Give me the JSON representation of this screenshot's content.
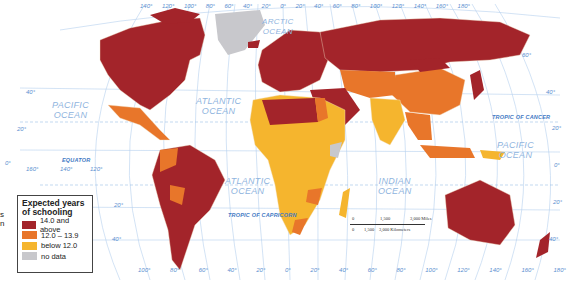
{
  "map": {
    "title": "Expected years of schooling",
    "oceans": [
      {
        "name": "ARCTIC\nOCEAN",
        "x": 262,
        "y": 17
      },
      {
        "name": "PACIFIC\nOCEAN",
        "x": 52,
        "y": 100
      },
      {
        "name": "ATLANTIC\nOCEAN",
        "x": 196,
        "y": 96
      },
      {
        "name": "ATLANTIC\nOCEAN",
        "x": 225,
        "y": 176
      },
      {
        "name": "INDIAN\nOCEAN",
        "x": 378,
        "y": 176
      },
      {
        "name": "PACIFIC\nOCEAN",
        "x": 497,
        "y": 140
      }
    ],
    "lines": {
      "equator": "EQUATOR",
      "tropic_cancer": "TROPIC OF CANCER",
      "tropic_capricorn": "TROPIC OF CAPRICORN"
    },
    "top_longitudes": [
      "140°",
      "120°",
      "100°",
      "80°",
      "60°",
      "40°",
      "20°",
      "0°",
      "20°",
      "40°",
      "60°",
      "80°",
      "100°",
      "120°",
      "140°",
      "160°",
      "180°"
    ],
    "bottom_longitudes": [
      "100°",
      "80°",
      "60°",
      "40°",
      "20°",
      "0°",
      "20°",
      "40°",
      "60°",
      "80°",
      "100°",
      "120°",
      "140°",
      "160°",
      "180°"
    ],
    "left_longitudes": [
      "160°",
      "140°",
      "120°"
    ],
    "left_latitudes": [
      "40°",
      "20°",
      "0°",
      "20°",
      "40°"
    ],
    "right_latitudes": [
      "60°",
      "40°",
      "20°",
      "0°",
      "20°",
      "40°"
    ],
    "scale": {
      "miles": [
        "0",
        "1,500",
        "3,000 Miles"
      ],
      "km": [
        "0",
        "1,500",
        "3,000 Kilometers"
      ]
    }
  },
  "legend": {
    "title_line1": "Expected years",
    "title_line2": "of schooling",
    "items": [
      {
        "label": "14.0 and above",
        "color": "#a3242a"
      },
      {
        "label": "12.0 – 13.9",
        "color": "#e8762a"
      },
      {
        "label": "below 12.0",
        "color": "#f5b52e"
      },
      {
        "label": "no data",
        "color": "#c8c8cc"
      }
    ]
  },
  "cut_text": [
    "s",
    "n"
  ],
  "colors": {
    "high": "#a3242a",
    "mid": "#e8762a",
    "low": "#f5b52e",
    "nodata": "#c8c8cc",
    "graticule": "#9cc0e6",
    "label": "#5b8fd0"
  }
}
